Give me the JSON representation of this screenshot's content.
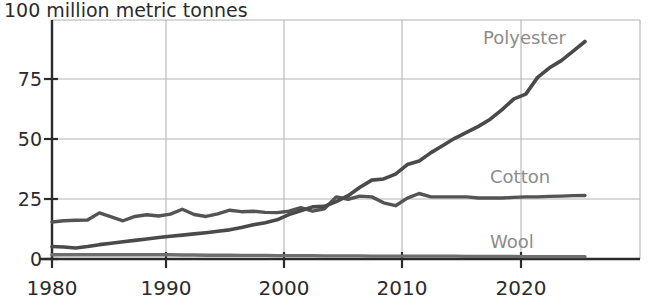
{
  "chart_data": {
    "type": "line",
    "title": "",
    "subtitle": "",
    "unit_label": "100 million metric tonnes",
    "xlabel": "",
    "ylabel": "million metric tonnes",
    "xlim": [
      1980,
      2025
    ],
    "ylim": [
      0,
      100
    ],
    "grid": true,
    "legend_position": "inline-right",
    "y_ticks": [
      "0",
      "25",
      "50",
      "75",
      "100"
    ],
    "y_tick_values": [
      0,
      25,
      50,
      75,
      100
    ],
    "x_ticks": [
      "1980",
      "1990",
      "2000",
      "2010",
      "2020"
    ],
    "x_tick_values": [
      1980,
      1990,
      2000,
      2010,
      2020
    ],
    "x": [
      1980,
      1981,
      1982,
      1983,
      1984,
      1985,
      1986,
      1987,
      1988,
      1989,
      1990,
      1991,
      1992,
      1993,
      1994,
      1995,
      1996,
      1997,
      1998,
      1999,
      2000,
      2001,
      2002,
      2003,
      2004,
      2005,
      2006,
      2007,
      2008,
      2009,
      2010,
      2011,
      2012,
      2013,
      2014,
      2015,
      2016,
      2017,
      2018,
      2019,
      2020,
      2021,
      2022,
      2023,
      2024,
      2025
    ],
    "series": [
      {
        "name": "Polyester",
        "label": "Polyester",
        "color": "#4a4a4a",
        "values": [
          5.2,
          5.0,
          4.6,
          5.2,
          6.0,
          6.6,
          7.2,
          7.8,
          8.4,
          9.0,
          9.5,
          10.0,
          10.5,
          11.0,
          11.6,
          12.2,
          13.2,
          14.3,
          15.2,
          16.4,
          18.6,
          20.2,
          21.8,
          22.0,
          24.0,
          26.5,
          30.0,
          33.0,
          33.5,
          35.5,
          39.5,
          41.0,
          44.5,
          47.5,
          50.5,
          53.0,
          55.5,
          58.5,
          62.5,
          67.0,
          69.0,
          76.0,
          80.0,
          83.0,
          87.0,
          91.0
        ]
      },
      {
        "name": "Cotton",
        "label": "Cotton",
        "color": "#545454",
        "values": [
          15.5,
          16.0,
          16.2,
          16.3,
          19.3,
          17.6,
          16.0,
          17.8,
          18.5,
          18.0,
          18.8,
          20.8,
          18.6,
          17.8,
          18.9,
          20.4,
          19.8,
          20.0,
          19.5,
          19.4,
          20.0,
          21.5,
          20.0,
          21.0,
          26.0,
          25.0,
          26.3,
          26.0,
          23.5,
          22.3,
          25.5,
          27.4,
          26.0,
          26.0,
          26.0,
          26.0,
          25.5,
          25.5,
          25.5,
          25.8,
          26.0,
          26.0,
          26.2,
          26.3,
          26.5,
          26.6
        ]
      },
      {
        "name": "Wool",
        "label": "Wool",
        "color": "#6e6e6e",
        "values": [
          1.8,
          1.8,
          1.8,
          1.8,
          1.8,
          1.8,
          1.8,
          1.8,
          1.8,
          1.8,
          1.8,
          1.7,
          1.7,
          1.6,
          1.6,
          1.6,
          1.5,
          1.5,
          1.5,
          1.4,
          1.4,
          1.4,
          1.4,
          1.3,
          1.3,
          1.3,
          1.3,
          1.2,
          1.2,
          1.2,
          1.2,
          1.2,
          1.2,
          1.2,
          1.2,
          1.1,
          1.1,
          1.1,
          1.1,
          1.1,
          1.0,
          1.0,
          1.0,
          1.0,
          1.0,
          1.0
        ]
      }
    ],
    "colors": {
      "axis": "#2b2b2b",
      "grid": "#b4b4b4",
      "polyester": "#4a4a4a",
      "cotton": "#545454",
      "wool": "#6e6e6e",
      "series_label": "#8c8c8c",
      "background": "#ffffff"
    }
  }
}
